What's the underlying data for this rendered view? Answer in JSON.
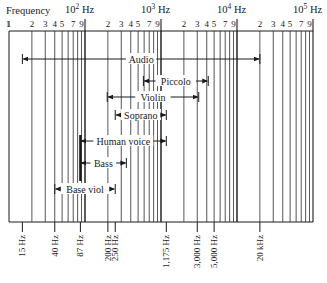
{
  "chart_data": {
    "type": "range-diagram",
    "title": "Frequency",
    "axis": {
      "scale": "log",
      "range_hz": [
        10,
        100000
      ],
      "decade_labels": [
        {
          "value": 100,
          "label": "10",
          "exp": "2",
          "unit": "Hz"
        },
        {
          "value": 1000,
          "label": "10",
          "exp": "3",
          "unit": "Hz"
        },
        {
          "value": 10000,
          "label": "10",
          "exp": "4",
          "unit": "Hz"
        },
        {
          "value": 100000,
          "label": "10",
          "exp": "5",
          "unit": "Hz"
        }
      ],
      "minor_tick_labels": [
        "1",
        "2",
        "3",
        "4",
        "5",
        "7",
        "9"
      ],
      "grid": true
    },
    "ranges": [
      {
        "name": "Audio",
        "low_hz": 15,
        "high_hz": 20000,
        "row": 0
      },
      {
        "name": "Piccolo",
        "low_hz": 587,
        "high_hz": 4186,
        "row": 1
      },
      {
        "name": "Violin",
        "low_hz": 196,
        "high_hz": 3136,
        "row": 2
      },
      {
        "name": "Soprano",
        "low_hz": 250,
        "high_hz": 1175,
        "row": 3
      },
      {
        "name": "Human voice",
        "low_hz": 87,
        "high_hz": 1175,
        "row": 4
      },
      {
        "name": "Bass",
        "low_hz": 87,
        "high_hz": 350,
        "row": 5
      },
      {
        "name": "Base viol",
        "low_hz": 40,
        "high_hz": 250,
        "row": 6
      }
    ],
    "bottom_markers": [
      "15 Hz",
      "40 Hz",
      "87 Hz",
      "200 Hz",
      "250 Hz",
      "1,175 Hz",
      "3,000 Hz",
      "5,000 Hz",
      "20 kHz"
    ],
    "marker_values_hz": [
      15,
      40,
      87,
      200,
      250,
      1175,
      3000,
      5000,
      20000
    ]
  },
  "header": {
    "frequency_label": "Frequency",
    "hz": "Hz"
  }
}
